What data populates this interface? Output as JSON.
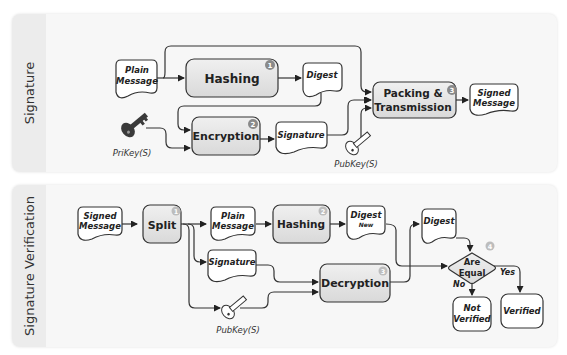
{
  "panels": {
    "signature": {
      "label": "Signature",
      "nodes": {
        "plain_message": [
          "Plain",
          "Message"
        ],
        "hashing": {
          "label": "Hashing",
          "step": "1"
        },
        "digest": "Digest",
        "encryption": {
          "label": "Encryption",
          "step": "2"
        },
        "signature": "Signature",
        "packing": {
          "label": [
            "Packing &",
            "Transmission"
          ],
          "step": "3"
        },
        "signed_message": [
          "Signed",
          "Message"
        ],
        "private_key": "PriKey(S)",
        "public_key": "PubKey(S)"
      }
    },
    "verification": {
      "label": "Signature Verification",
      "nodes": {
        "signed_message": [
          "Signed",
          "Message"
        ],
        "split": {
          "label": "Split",
          "step": "1"
        },
        "plain_message": [
          "Plain",
          "Message"
        ],
        "hashing": {
          "label": "Hashing",
          "step": "2"
        },
        "digest_new": [
          "Digest",
          "New"
        ],
        "signature": "Signature",
        "decryption": {
          "label": "Decryption",
          "step": "3"
        },
        "digest": "Digest",
        "are_equal": {
          "label": [
            "Are",
            "Equal"
          ],
          "step": "4"
        },
        "yes": "Yes",
        "no": "No",
        "not_verified": [
          "Not",
          "Verified"
        ],
        "verified": "Verified",
        "public_key": "PubKey(S)"
      }
    }
  },
  "colors": {
    "process_fill": "#e6e6e6",
    "data_fill": "#ffffff",
    "stroke": "#333333",
    "badge": "#8a8a8a",
    "key": "#444444"
  }
}
